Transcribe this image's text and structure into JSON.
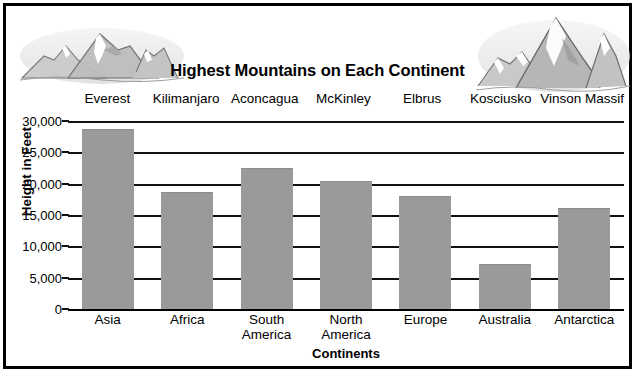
{
  "chart_data": {
    "type": "bar",
    "title": "Highest Mountains on Each Continent",
    "xlabel": "Continents",
    "ylabel": "Height in Feet",
    "categories": [
      "Asia",
      "Africa",
      "South\nAmerica",
      "North\nAmerica",
      "Europe",
      "Australia",
      "Antarctica"
    ],
    "point_labels": [
      "Everest",
      "Kilimanjaro",
      "Aconcagua",
      "McKinley",
      "Elbrus",
      "Kosciusko",
      "Vinson Massif"
    ],
    "values": [
      28500,
      18500,
      22400,
      20300,
      17800,
      7100,
      16000
    ],
    "ylim": [
      0,
      30000
    ],
    "ytick_labels": [
      "30,000",
      "25,000",
      "20,000",
      "15,000",
      "10,000",
      "5,000",
      "0"
    ],
    "ytick_values": [
      30000,
      25000,
      20000,
      15000,
      10000,
      5000,
      0
    ],
    "grid": true,
    "legend": "none",
    "bar_color": "#9a9a9a",
    "axis_color": "#000000",
    "background": "#ffffff"
  },
  "decor": {
    "left_art_name": "mountain-range-sketch-left",
    "right_art_name": "mountain-range-sketch-right"
  }
}
